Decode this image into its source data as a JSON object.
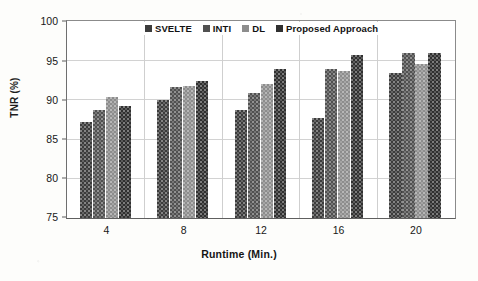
{
  "chart_data": {
    "type": "bar",
    "title": "",
    "xlabel": "Runtime (Min.)",
    "ylabel": "TNR (%)",
    "categories": [
      "4",
      "8",
      "12",
      "16",
      "20"
    ],
    "ylim": [
      75,
      100
    ],
    "yticks": [
      75,
      80,
      85,
      90,
      95,
      100
    ],
    "grid": "horizontal-and-vertical",
    "legend_position": "top-center",
    "series": [
      {
        "name": "SVELTE",
        "color": "#3c3c3c",
        "values": [
          87.3,
          90.1,
          88.8,
          87.7,
          93.5
        ]
      },
      {
        "name": "INTI",
        "color": "#515151",
        "values": [
          88.8,
          91.7,
          91.0,
          94.0,
          96.0
        ]
      },
      {
        "name": "DL",
        "color": "#8d8d8d",
        "values": [
          90.4,
          91.9,
          92.1,
          93.7,
          94.7
        ]
      },
      {
        "name": "Proposed Approach",
        "color": "#303030",
        "values": [
          89.3,
          92.5,
          94.0,
          95.8,
          96.0
        ]
      }
    ]
  },
  "legend": {
    "items": [
      {
        "label": "SVELTE"
      },
      {
        "label": "INTI"
      },
      {
        "label": "DL"
      },
      {
        "label": "Proposed Approach"
      }
    ]
  },
  "axis": {
    "y_label": "TNR (%)",
    "x_label": "Runtime (Min.)",
    "y_ticks": [
      "100",
      "95",
      "90",
      "85",
      "80",
      "75"
    ],
    "x_ticks": [
      "4",
      "8",
      "12",
      "16",
      "20"
    ]
  }
}
